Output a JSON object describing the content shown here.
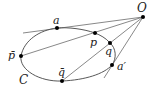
{
  "diagram": {
    "type": "geometric-figure",
    "curve": {
      "label": "C"
    },
    "points": [
      {
        "id": "O",
        "label": "O",
        "x": 143,
        "y": 17
      },
      {
        "id": "a",
        "label": "a",
        "x": 57,
        "y": 28
      },
      {
        "id": "p",
        "label": "p",
        "x": 95,
        "y": 33
      },
      {
        "id": "q",
        "label": "q",
        "x": 110,
        "y": 43
      },
      {
        "id": "a_prime",
        "label": "a′",
        "x": 112,
        "y": 65
      },
      {
        "id": "p_bar",
        "label": "p̄",
        "x": 21,
        "y": 56
      },
      {
        "id": "q_bar",
        "label": "q̄",
        "x": 62,
        "y": 81
      }
    ],
    "lines": [
      {
        "name": "tangent O-a",
        "from": "O",
        "to": "a",
        "extends_past": "a"
      },
      {
        "name": "secant O-p-p̄",
        "from": "O",
        "to": "p_bar",
        "through": "p"
      },
      {
        "name": "secant O-q-q̄",
        "from": "O",
        "to": "q_bar",
        "through": "q"
      },
      {
        "name": "tangent O-a′",
        "from": "O",
        "to": "a_prime",
        "extends_past": "a_prime"
      }
    ],
    "labels": {
      "O": "O",
      "a": "a",
      "p": "p",
      "q": "q",
      "a_prime": "a′",
      "p_bar": "p̄",
      "q_bar": "q̄",
      "C": "C"
    }
  }
}
